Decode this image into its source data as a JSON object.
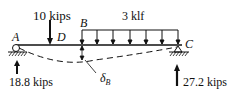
{
  "diagram": {
    "loads": {
      "point_load": "10 kips",
      "distributed_load": "3 klf"
    },
    "points": {
      "A": "A",
      "B": "B",
      "C": "C",
      "D": "D"
    },
    "reactions": {
      "left": "18.8 kips",
      "right": "27.2 kips"
    },
    "deflection_label": "δ",
    "deflection_sub": "B",
    "colors": {
      "ink": "#111111",
      "background": "#ffffff"
    }
  }
}
